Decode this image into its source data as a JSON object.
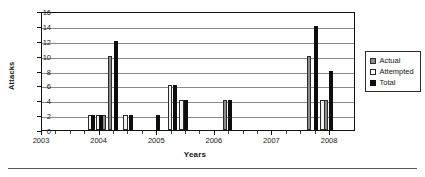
{
  "chart_data": {
    "type": "bar",
    "title": "",
    "subtitle": "",
    "xlabel": "Years",
    "ylabel": "Attacks",
    "ylim": [
      0,
      16
    ],
    "ytick_step": 2,
    "yticks": [
      0,
      2,
      4,
      6,
      8,
      10,
      12,
      14,
      16
    ],
    "xticks": [
      "2003",
      "2004",
      "2005",
      "2006",
      "2007",
      "2008"
    ],
    "xlim": [
      2003,
      2008.45
    ],
    "grid": "horizontal",
    "legend_position": "right",
    "legend": [
      "Actual",
      "Attempted",
      "Total"
    ],
    "series": [
      {
        "name": "Actual",
        "color": "#8c8c8c",
        "points": [
          {
            "x": 2004.08,
            "value": 2
          },
          {
            "x": 2004.18,
            "value": 10
          },
          {
            "x": 2006.17,
            "value": 4
          },
          {
            "x": 2007.64,
            "value": 10
          },
          {
            "x": 2007.93,
            "value": 4
          }
        ]
      },
      {
        "name": "Attempted",
        "color": "#f2f2f2",
        "points": [
          {
            "x": 2003.83,
            "value": 2
          },
          {
            "x": 2003.98,
            "value": 2
          },
          {
            "x": 2004.45,
            "value": 2
          },
          {
            "x": 2005.22,
            "value": 6
          },
          {
            "x": 2005.42,
            "value": 4
          },
          {
            "x": 2007.87,
            "value": 4
          }
        ]
      },
      {
        "name": "Total",
        "color": "#0d0d0d",
        "points": [
          {
            "x": 2003.88,
            "value": 2
          },
          {
            "x": 2004.03,
            "value": 2
          },
          {
            "x": 2004.28,
            "value": 12
          },
          {
            "x": 2004.55,
            "value": 2
          },
          {
            "x": 2005.02,
            "value": 2
          },
          {
            "x": 2005.31,
            "value": 6
          },
          {
            "x": 2005.5,
            "value": 4
          },
          {
            "x": 2006.26,
            "value": 4
          },
          {
            "x": 2007.76,
            "value": 14
          },
          {
            "x": 2008.02,
            "value": 8
          }
        ]
      }
    ]
  }
}
